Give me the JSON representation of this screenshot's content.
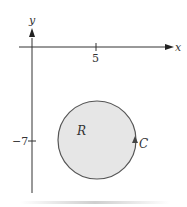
{
  "diagram": {
    "axes": {
      "x_label": "x",
      "y_label": "y",
      "x_tick_label": "5",
      "y_tick_label": "−7"
    },
    "region": {
      "label": "R",
      "fill_color": "#e6e6e6",
      "stroke_color": "#555555"
    },
    "curve": {
      "label": "C",
      "orientation": "counterclockwise"
    },
    "circle": {
      "center": [
        5,
        -7
      ],
      "shape": "circle"
    }
  }
}
